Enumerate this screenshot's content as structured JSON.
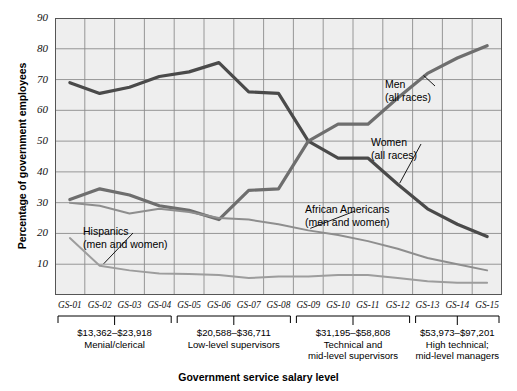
{
  "chart_data": {
    "type": "line",
    "title": "",
    "xlabel": "Government service salary level",
    "ylabel": "Percentage of government employees",
    "ylim": [
      0,
      90
    ],
    "yticks": [
      10,
      20,
      30,
      40,
      50,
      60,
      70,
      80,
      90
    ],
    "grid": true,
    "legend_position": "inline-annotations",
    "categories": [
      "GS-01",
      "GS-02",
      "GS-03",
      "GS-04",
      "GS-05",
      "GS-06",
      "GS-07",
      "GS-08",
      "GS-09",
      "GS-10",
      "GS-11",
      "GS-12",
      "GS-13",
      "GS-14",
      "GS-15"
    ],
    "series": [
      {
        "name": "Women (all races)",
        "color": "#4a4a4a",
        "values": [
          69,
          65.5,
          67.5,
          71,
          72.5,
          75.5,
          66,
          65.5,
          50,
          44.5,
          44.5,
          36,
          28,
          23,
          19
        ]
      },
      {
        "name": "Men (all races)",
        "color": "#6e6e6e",
        "values": [
          31,
          34.5,
          32.5,
          29,
          27.5,
          24.5,
          34,
          34.5,
          50,
          55.5,
          55.5,
          64,
          72,
          77,
          81
        ]
      },
      {
        "name": "African Americans (men and women)",
        "color": "#8e8e8e",
        "values": [
          30,
          29,
          26.5,
          28,
          27,
          25,
          24.5,
          23,
          21,
          19.5,
          17.5,
          15,
          12,
          10,
          8
        ]
      },
      {
        "name": "Hispanics (men and women)",
        "color": "#9d9d9d",
        "values": [
          18.5,
          9.5,
          8,
          7,
          6.8,
          6.5,
          5.5,
          6,
          6,
          6.5,
          6.5,
          5.5,
          4.5,
          4,
          4
        ]
      }
    ],
    "annotations": [
      {
        "label_line1": "Men",
        "label_line2": "(all races)"
      },
      {
        "label_line1": "Women",
        "label_line2": "(all races)"
      },
      {
        "label_line1": "African Americans",
        "label_line2": "(men and women)"
      },
      {
        "label_line1": "Hispanics",
        "label_line2": "(men and women)"
      }
    ],
    "salary_groups": [
      {
        "range": "$13,362–$23,918",
        "desc_line1": "Menial/clerical",
        "desc_line2": "",
        "levels": [
          "GS-01",
          "GS-02",
          "GS-03",
          "GS-04"
        ]
      },
      {
        "range": "$20,588–$36,711",
        "desc_line1": "Low-level supervisors",
        "desc_line2": "",
        "levels": [
          "GS-05",
          "GS-06",
          "GS-07",
          "GS-08"
        ]
      },
      {
        "range": "$31,195–$58,808",
        "desc_line1": "Technical and",
        "desc_line2": "mid-level supervisors",
        "levels": [
          "GS-09",
          "GS-10",
          "GS-11",
          "GS-12"
        ]
      },
      {
        "range": "$53,973–$97,201",
        "desc_line1": "High technical;",
        "desc_line2": "mid-level managers",
        "levels": [
          "GS-13",
          "GS-14",
          "GS-15"
        ]
      }
    ]
  },
  "axes": {
    "ylabel": "Percentage of government employees",
    "xlabel": "Government service salary level",
    "yticks": [
      "90",
      "80",
      "70",
      "60",
      "50",
      "40",
      "30",
      "20",
      "10"
    ],
    "xticks": [
      "GS-01",
      "GS-02",
      "GS-03",
      "GS-04",
      "GS-05",
      "GS-06",
      "GS-07",
      "GS-08",
      "GS-09",
      "GS-10",
      "GS-11",
      "GS-12",
      "GS-13",
      "GS-14",
      "GS-15"
    ]
  },
  "annotations": {
    "men": {
      "l1": "Men",
      "l2": "(all races)"
    },
    "women": {
      "l1": "Women",
      "l2": "(all races)"
    },
    "african_americans": {
      "l1": "African Americans",
      "l2": "(men and women)"
    },
    "hispanics": {
      "l1": "Hispanics",
      "l2": "(men and women)"
    }
  },
  "groups": [
    {
      "amount": "$13,362–$23,918",
      "d1": "Menial/clerical",
      "d2": ""
    },
    {
      "amount": "$20,588–$36,711",
      "d1": "Low-level supervisors",
      "d2": ""
    },
    {
      "amount": "$31,195–$58,808",
      "d1": "Technical and",
      "d2": "mid-level supervisors"
    },
    {
      "amount": "$53,973–$97,201",
      "d1": "High technical;",
      "d2": "mid-level managers"
    }
  ],
  "colors": {
    "plot_bg": "#eeeeee",
    "grid": "#8c8c8c",
    "women": "#4a4a4a",
    "men": "#6e6e6e",
    "african_americans": "#8e8e8e",
    "hispanics": "#9d9d9d"
  }
}
